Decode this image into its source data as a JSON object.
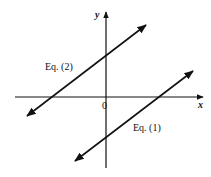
{
  "diagram": {
    "type": "coordinate-plane-parallel-lines",
    "axes": {
      "x_label": "x",
      "y_label": "y",
      "origin_label": "0"
    },
    "lines": [
      {
        "name": "Eq. (1)",
        "label": "Eq. (1)",
        "description": "line with positive slope, negative y-intercept, positive x-intercept"
      },
      {
        "name": "Eq. (2)",
        "label": "Eq. (2)",
        "description": "line with positive slope, positive y-intercept, negative x-intercept"
      }
    ],
    "relationship": "parallel",
    "colors": {
      "ink": "#111111",
      "background": "#ffffff"
    }
  }
}
